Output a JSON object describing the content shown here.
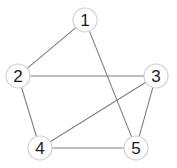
{
  "figure": {
    "kind": "undirected-graph",
    "width": 177,
    "height": 168,
    "background_color": "#ffffff",
    "edge_color": "#808080",
    "node_fill_color": "#ffffff",
    "node_border_color": "#cfcfcf",
    "node_label_color": "#1a1a1a",
    "node_radius": 12
  },
  "nodes": [
    {
      "id": "1",
      "label": "1",
      "x": 85,
      "y": 20
    },
    {
      "id": "2",
      "label": "2",
      "x": 18,
      "y": 76
    },
    {
      "id": "3",
      "label": "3",
      "x": 156,
      "y": 76
    },
    {
      "id": "4",
      "label": "4",
      "x": 40,
      "y": 148
    },
    {
      "id": "5",
      "label": "5",
      "x": 136,
      "y": 148
    }
  ],
  "edges": [
    {
      "id": "edge-1-2",
      "source": "1",
      "target": "2",
      "x1": 85,
      "y1": 20,
      "x2": 18,
      "y2": 76
    },
    {
      "id": "edge-1-5",
      "source": "1",
      "target": "5",
      "x1": 85,
      "y1": 20,
      "x2": 136,
      "y2": 148
    },
    {
      "id": "edge-2-3",
      "source": "2",
      "target": "3",
      "x1": 18,
      "y1": 76,
      "x2": 156,
      "y2": 76
    },
    {
      "id": "edge-2-4",
      "source": "2",
      "target": "4",
      "x1": 18,
      "y1": 76,
      "x2": 40,
      "y2": 148
    },
    {
      "id": "edge-3-4",
      "source": "3",
      "target": "4",
      "x1": 156,
      "y1": 76,
      "x2": 40,
      "y2": 148
    },
    {
      "id": "edge-3-5",
      "source": "3",
      "target": "5",
      "x1": 156,
      "y1": 76,
      "x2": 136,
      "y2": 148
    },
    {
      "id": "edge-4-5",
      "source": "4",
      "target": "5",
      "x1": 40,
      "y1": 148,
      "x2": 136,
      "y2": 148
    }
  ]
}
